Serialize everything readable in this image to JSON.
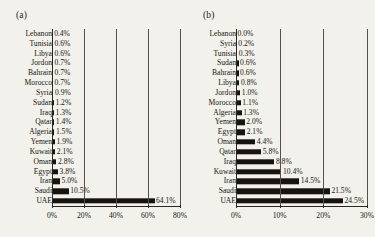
{
  "figure": {
    "background_color": "#f3f1ec",
    "bar_color": "#16140f",
    "text_color": "#17150f"
  },
  "chart_data": [
    {
      "type": "bar",
      "panel": "(a)",
      "orientation": "horizontal",
      "title": "",
      "xlabel": "",
      "ylabel": "",
      "xlim": [
        0,
        80
      ],
      "xticks": [
        "0%",
        "20%",
        "40%",
        "60%",
        "80%"
      ],
      "xtick_values": [
        0,
        20,
        40,
        60,
        80
      ],
      "grid": true,
      "legend": "none",
      "categories": [
        "Lebanon",
        "Tunisia",
        "Libya",
        "Jordon",
        "Bahrain",
        "Morocco",
        "Syria",
        "Sudan",
        "Iraq",
        "Qatar",
        "Algeria",
        "Yemen",
        "Kuwait",
        "Oman",
        "Egypt",
        "Iran",
        "Saudi",
        "UAE"
      ],
      "values": [
        0.4,
        0.6,
        0.6,
        0.7,
        0.7,
        0.7,
        0.9,
        1.2,
        1.3,
        1.4,
        1.5,
        1.9,
        2.1,
        2.8,
        3.8,
        5.0,
        10.5,
        64.1
      ],
      "data_labels": [
        "0.4%",
        "0.6%",
        "0.6%",
        "0.7%",
        "0.7%",
        "0.7%",
        "0.9%",
        "1.2%",
        "1.3%",
        "1.4%",
        "1.5%",
        "1.9%",
        "2.1%",
        "2.8%",
        "3.8%",
        "5.0%",
        "10.5%",
        "64.1%"
      ]
    },
    {
      "type": "bar",
      "panel": "(b)",
      "orientation": "horizontal",
      "title": "",
      "xlabel": "",
      "ylabel": "",
      "xlim": [
        0,
        30
      ],
      "xticks": [
        "0%",
        "10%",
        "20%",
        "30%"
      ],
      "xtick_values": [
        0,
        10,
        20,
        30
      ],
      "grid": true,
      "legend": "none",
      "categories": [
        "Lebanon",
        "Syria",
        "Tunisia",
        "Sudan",
        "Bahrain",
        "Libya",
        "Jordon",
        "Morocco",
        "Algeria",
        "Yemen",
        "Egypt",
        "Oman",
        "Qatar",
        "Iraq",
        "Kuwait",
        "Iran",
        "Saudi",
        "UAE"
      ],
      "values": [
        0.0,
        0.2,
        0.3,
        0.6,
        0.6,
        0.8,
        1.0,
        1.1,
        1.3,
        2.0,
        2.1,
        4.4,
        5.8,
        8.8,
        10.4,
        14.5,
        21.5,
        24.5
      ],
      "data_labels": [
        "0.0%",
        "0.2%",
        "0.3%",
        "0.6%",
        "0.6%",
        "0.8%",
        "1.0%",
        "1.1%",
        "1.3%",
        "2.0%",
        "2.1%",
        "4.4%",
        "5.8%",
        "8.8%",
        "10.4%",
        "14.5%",
        "21.5%",
        "24.5%"
      ]
    }
  ]
}
